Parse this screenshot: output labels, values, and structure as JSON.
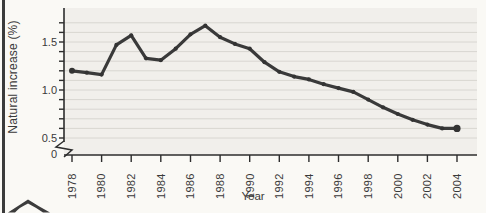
{
  "decor": {
    "showthrough_text": "noihslqoq Isnoitsn sdt ni sassioni Isiutsn sdT anoitsluqoq"
  },
  "chart_data": {
    "type": "line",
    "title": "",
    "xlabel": "Year",
    "ylabel": "Natural increase (%)",
    "x_range": [
      1978,
      2004
    ],
    "ylim_display": [
      0.5,
      1.75
    ],
    "axis_break_below": 0.5,
    "grid": "horizontal every 0.1",
    "legend": "none",
    "line_color": "#3a3a3a",
    "plot_bg": "#f1efeb",
    "gridline_color": "#d8d6d1",
    "axis_color": "#2d2d2d",
    "years": [
      1978,
      1979,
      1980,
      1981,
      1982,
      1983,
      1984,
      1985,
      1986,
      1987,
      1988,
      1989,
      1990,
      1991,
      1992,
      1993,
      1994,
      1995,
      1996,
      1997,
      1998,
      1999,
      2000,
      2001,
      2002,
      2003,
      2004
    ],
    "values": [
      1.2,
      1.18,
      1.16,
      1.47,
      1.57,
      1.33,
      1.31,
      1.43,
      1.58,
      1.67,
      1.55,
      1.48,
      1.43,
      1.29,
      1.19,
      1.14,
      1.11,
      1.06,
      1.02,
      0.98,
      0.9,
      0.82,
      0.75,
      0.69,
      0.64,
      0.6,
      0.6
    ],
    "x_tick_labels": [
      "1978",
      "1980",
      "1982",
      "1984",
      "1986",
      "1988",
      "1990",
      "1992",
      "1994",
      "1996",
      "1998",
      "2000",
      "2002",
      "2004"
    ],
    "y_tick_labels": [
      {
        "value": 0,
        "label": "0"
      },
      {
        "value": 0.5,
        "label": "0.5"
      },
      {
        "value": 1.0,
        "label": "1.0"
      },
      {
        "value": 1.5,
        "label": "1.5"
      }
    ]
  }
}
